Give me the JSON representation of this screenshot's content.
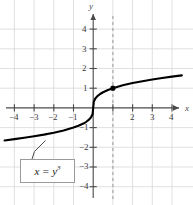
{
  "figure": {
    "kind": "cartesian-plot",
    "background_color": "#ffffff",
    "grid_color": "#d8d8d8",
    "axis_color": "#4a4a4a",
    "curve_color": "#000000",
    "dashed_line_color": "#9a9a9a",
    "callout_border_color": "#9a9a9a"
  },
  "axes": {
    "x_name": "x",
    "y_name": "y",
    "x_ticks": [
      {
        "value": -4,
        "label": "−4"
      },
      {
        "value": -3,
        "label": "−3"
      },
      {
        "value": -2,
        "label": "−2"
      },
      {
        "value": -1,
        "label": "−1"
      },
      {
        "value": 2,
        "label": "2"
      },
      {
        "value": 3,
        "label": "3"
      },
      {
        "value": 4,
        "label": "4"
      }
    ],
    "y_ticks": [
      {
        "value": 4,
        "label": "4"
      },
      {
        "value": 3,
        "label": "3"
      },
      {
        "value": 2,
        "label": "2"
      },
      {
        "value": 1,
        "label": "1"
      },
      {
        "value": -1,
        "label": "−1"
      },
      {
        "value": -2,
        "label": "−2"
      },
      {
        "value": -3,
        "label": "−3"
      },
      {
        "value": -4,
        "label": "−4"
      }
    ]
  },
  "annotations": {
    "curve_equation_prefix": "x = y",
    "curve_equation_exponent": "3",
    "marked_point": {
      "x": 1,
      "y": 1
    },
    "dashed_vertical_line_x": 1
  },
  "chart_data": {
    "type": "line",
    "title": "",
    "subtitle": "",
    "xlabel": "x",
    "ylabel": "y",
    "xlim": [
      -4.7,
      4.8
    ],
    "ylim": [
      -4.6,
      4.6
    ],
    "grid": true,
    "grid_step": 1,
    "legend": null,
    "equation": "x = y^3",
    "equation_solved": "y = x^(1/3)",
    "annotation_label": "x = y³",
    "marked_points": [
      {
        "x": 1,
        "y": 1
      }
    ],
    "reference_lines": [
      {
        "type": "vertical",
        "x": 1,
        "style": "dashed",
        "color": "#9a9a9a"
      }
    ],
    "series": [
      {
        "name": "x = y^3",
        "x": [
          -4.5,
          -4.0,
          -3.5,
          -3.0,
          -2.5,
          -2.0,
          -1.5,
          -1.0,
          -0.75,
          -0.5,
          -0.35,
          -0.2,
          -0.1,
          -0.03,
          0,
          0.03,
          0.1,
          0.2,
          0.35,
          0.5,
          0.75,
          1.0,
          1.5,
          2.0,
          2.5,
          3.0,
          3.5,
          4.0,
          4.5
        ],
        "y": [
          -1.651,
          -1.587,
          -1.518,
          -1.442,
          -1.357,
          -1.26,
          -1.145,
          -1.0,
          -0.909,
          -0.794,
          -0.705,
          -0.585,
          -0.464,
          -0.311,
          0,
          0.311,
          0.464,
          0.585,
          0.705,
          0.794,
          0.909,
          1.0,
          1.145,
          1.26,
          1.357,
          1.442,
          1.518,
          1.587,
          1.651
        ]
      }
    ]
  }
}
